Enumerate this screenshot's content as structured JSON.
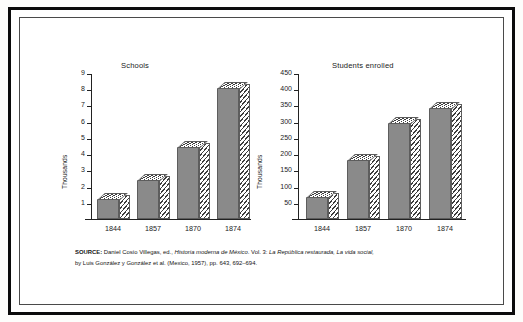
{
  "figure": {
    "source_note": {
      "lead": "SOURCE:",
      "line1_plain_a": " Daniel Cosío Villegas, ed., ",
      "line1_italic_a": "Historia moderna de México",
      "line1_plain_b": ". Vol. 3: ",
      "line1_italic_b": "La República restaurada, La vida social,",
      "line2_plain_a": "by Luis González y González et al. (Mexico, 1957), pp. 643, 692–694."
    }
  },
  "chart_data": [
    {
      "type": "bar",
      "title": "Schools",
      "xlabel": "",
      "ylabel": "Thousands",
      "categories": [
        "1844",
        "1857",
        "1870",
        "1874"
      ],
      "values": [
        1.25,
        2.4,
        4.45,
        8.1
      ],
      "ylim": [
        0,
        9
      ],
      "yticks": [
        1,
        2,
        3,
        4,
        5,
        6,
        7,
        8,
        9
      ],
      "grid": false,
      "legend": "none",
      "style": "3d-shaded-bars"
    },
    {
      "type": "bar",
      "title": "Students enrolled",
      "xlabel": "",
      "ylabel": "Thousands",
      "categories": [
        "1844",
        "1857",
        "1870",
        "1874"
      ],
      "values": [
        68,
        182,
        296,
        343
      ],
      "ylim": [
        0,
        450
      ],
      "yticks": [
        50,
        100,
        150,
        200,
        250,
        300,
        350,
        400,
        450
      ],
      "grid": false,
      "legend": "none",
      "style": "3d-shaded-bars"
    }
  ],
  "colors": {
    "bar_fill": "#8a8a8a",
    "bar_outline": "#5d5d5d",
    "hatch": "#3d3d3d",
    "axis": "#222222",
    "frame": "#0b0b0b",
    "background": "#ffffff",
    "text": "#1b1b1b"
  }
}
